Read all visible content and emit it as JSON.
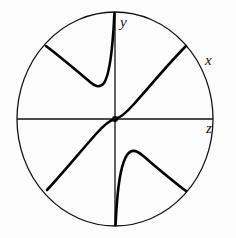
{
  "figure": {
    "name": "phase-portrait-disk",
    "background_color": "#fdfdfd",
    "stroke_color": "#111111",
    "curve_color": "#000000",
    "circle": {
      "label": "boundary-circle",
      "center_x": 115,
      "center_y": 119,
      "radius_x": 98,
      "radius_y": 107,
      "stroke_width": 1.3
    },
    "axes": {
      "horizontal": {
        "label": "z",
        "x1": 17,
        "y1": 119,
        "x2": 213,
        "y2": 119,
        "stroke_width": 1.3
      },
      "vertical": {
        "label": "y",
        "x1": 115,
        "y1": 12,
        "x2": 115,
        "y2": 226,
        "stroke_width": 1.3
      }
    },
    "labels": [
      {
        "name": "label-y",
        "text": "y",
        "x": 120,
        "y": 27
      },
      {
        "name": "label-x",
        "text": "x",
        "x": 205,
        "y": 65
      },
      {
        "name": "label-z",
        "text": "z",
        "x": 206,
        "y": 133
      }
    ],
    "trajectories": [
      {
        "name": "upper-left-branch",
        "path": "M 46 46 C 62 58, 78 72, 90 82 C 96 87, 100 88, 104 83 C 108 77, 111 62, 113 36 C 114 26, 114 18, 114.5 13",
        "stroke_width": 2.6
      },
      {
        "name": "central-diagonal-s-curve",
        "path": "M 47 190 C 62 174, 80 152, 96 134 C 104 125, 110 120, 115 119 C 120 118, 126 113, 134 104 C 150 86, 170 62, 186 46",
        "stroke_width": 2.6
      },
      {
        "name": "lower-right-branch",
        "path": "M 186 191 C 170 179, 154 165, 142 155 C 136 150, 131 149, 127 155 C 123 161, 119 176, 117 202 C 116 212, 116 220, 115.5 225",
        "stroke_width": 2.6
      }
    ]
  }
}
